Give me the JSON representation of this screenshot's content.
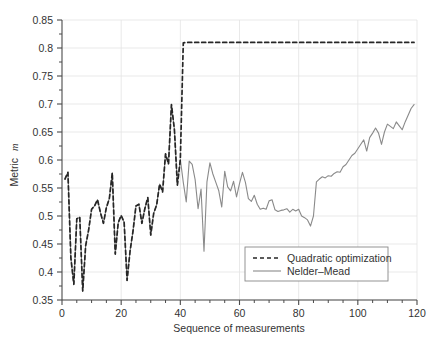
{
  "chart_data": {
    "type": "line",
    "title": "",
    "xlabel": "Sequence of measurements",
    "ylabel": "Metric m",
    "ylabel_plain": "Metric",
    "ylabel_italic": "m",
    "xlim": [
      0,
      120
    ],
    "ylim": [
      0.35,
      0.85
    ],
    "xticks": [
      0,
      20,
      40,
      60,
      80,
      100,
      120
    ],
    "xtick_labels": [
      "0",
      "20",
      "40",
      "60",
      "80",
      "100",
      "120"
    ],
    "yticks": [
      0.35,
      0.4,
      0.45,
      0.5,
      0.55,
      0.6,
      0.65,
      0.7,
      0.75,
      0.8,
      0.85
    ],
    "ytick_labels": [
      "0.35",
      "0.4",
      "0.45",
      "0.5",
      "0.55",
      "0.6",
      "0.65",
      "0.7",
      "0.75",
      "0.8",
      "0.85"
    ],
    "x_minor_tick_step": 5,
    "y_minor_tick_step": 0.025,
    "grid": true,
    "grid_color": "#e3e3e3",
    "axis_color": "#4a4a4a",
    "background": "#ffffff",
    "legend_position": "lower right",
    "series": [
      {
        "name": "Quadratic optimization",
        "style": "dashed",
        "color": "#262626",
        "x": [
          1,
          2,
          3,
          4,
          5,
          6,
          7,
          8,
          9,
          10,
          11,
          12,
          13,
          14,
          15,
          16,
          17,
          18,
          19,
          20,
          21,
          22,
          23,
          24,
          25,
          26,
          27,
          28,
          29,
          30,
          31,
          32,
          33,
          34,
          35,
          36,
          37,
          38,
          39,
          40,
          41,
          42,
          60,
          80,
          100,
          119
        ],
        "values": [
          0.566,
          0.578,
          0.425,
          0.378,
          0.495,
          0.498,
          0.366,
          0.447,
          0.475,
          0.512,
          0.518,
          0.529,
          0.506,
          0.487,
          0.515,
          0.531,
          0.577,
          0.432,
          0.488,
          0.501,
          0.489,
          0.385,
          0.437,
          0.473,
          0.518,
          0.521,
          0.487,
          0.513,
          0.533,
          0.466,
          0.505,
          0.52,
          0.557,
          0.543,
          0.611,
          0.593,
          0.699,
          0.654,
          0.555,
          0.601,
          0.809,
          0.81,
          0.81,
          0.81,
          0.81,
          0.81
        ]
      },
      {
        "name": "Nelder–Mead",
        "style": "solid",
        "color": "#8a8a8a",
        "x": [
          1,
          2,
          3,
          4,
          5,
          6,
          7,
          8,
          9,
          10,
          11,
          12,
          13,
          14,
          15,
          16,
          17,
          18,
          19,
          20,
          21,
          22,
          23,
          24,
          25,
          26,
          27,
          28,
          29,
          30,
          31,
          32,
          33,
          34,
          35,
          36,
          37,
          38,
          39,
          40,
          41,
          42,
          43,
          44,
          45,
          46,
          47,
          48,
          49,
          50,
          51,
          52,
          53,
          54,
          55,
          56,
          57,
          58,
          59,
          60,
          61,
          62,
          63,
          64,
          65,
          66,
          67,
          68,
          69,
          70,
          71,
          72,
          73,
          74,
          75,
          76,
          77,
          78,
          79,
          80,
          81,
          82,
          83,
          84,
          85,
          86,
          87,
          88,
          89,
          90,
          91,
          92,
          93,
          94,
          95,
          96,
          97,
          98,
          99,
          100,
          101,
          102,
          103,
          104,
          105,
          106,
          107,
          108,
          109,
          110,
          111,
          112,
          113,
          114,
          115,
          116,
          117,
          118,
          119
        ],
        "values": [
          0.566,
          0.578,
          0.425,
          0.378,
          0.495,
          0.498,
          0.366,
          0.447,
          0.475,
          0.512,
          0.518,
          0.529,
          0.506,
          0.487,
          0.515,
          0.531,
          0.577,
          0.432,
          0.488,
          0.501,
          0.489,
          0.385,
          0.437,
          0.473,
          0.518,
          0.521,
          0.487,
          0.513,
          0.533,
          0.466,
          0.505,
          0.52,
          0.557,
          0.543,
          0.611,
          0.593,
          0.699,
          0.654,
          0.555,
          0.601,
          0.56,
          0.525,
          0.598,
          0.592,
          0.565,
          0.513,
          0.548,
          0.437,
          0.561,
          0.595,
          0.575,
          0.56,
          0.545,
          0.516,
          0.58,
          0.552,
          0.545,
          0.562,
          0.534,
          0.558,
          0.578,
          0.56,
          0.531,
          0.526,
          0.537,
          0.521,
          0.512,
          0.514,
          0.512,
          0.527,
          0.529,
          0.511,
          0.508,
          0.51,
          0.511,
          0.513,
          0.507,
          0.512,
          0.509,
          0.512,
          0.5,
          0.497,
          0.493,
          0.482,
          0.5,
          0.561,
          0.566,
          0.57,
          0.568,
          0.572,
          0.571,
          0.576,
          0.579,
          0.578,
          0.588,
          0.592,
          0.6,
          0.608,
          0.612,
          0.62,
          0.628,
          0.636,
          0.616,
          0.64,
          0.648,
          0.657,
          0.648,
          0.628,
          0.65,
          0.664,
          0.66,
          0.656,
          0.668,
          0.661,
          0.654,
          0.668,
          0.68,
          0.692,
          0.699
        ]
      }
    ]
  },
  "legend": {
    "entries": [
      {
        "label": "Quadratic optimization",
        "style": "dashed"
      },
      {
        "label": "Nelder–Mead",
        "style": "solid"
      }
    ]
  }
}
